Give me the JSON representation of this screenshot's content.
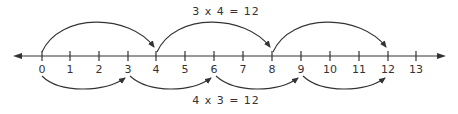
{
  "diagram": {
    "type": "number-line",
    "top_equation": "3 x 4 = 12",
    "bottom_equation": "4 x 3 = 12",
    "ticks": [
      "0",
      "1",
      "2",
      "3",
      "4",
      "5",
      "6",
      "7",
      "8",
      "9",
      "10",
      "11",
      "12",
      "13"
    ],
    "top_jumps": {
      "size": 4,
      "count": 3,
      "points": [
        0,
        4,
        8,
        12
      ]
    },
    "bottom_jumps": {
      "size": 3,
      "count": 4,
      "points": [
        0,
        3,
        6,
        9,
        12
      ]
    },
    "stroke_color": "#333333"
  }
}
